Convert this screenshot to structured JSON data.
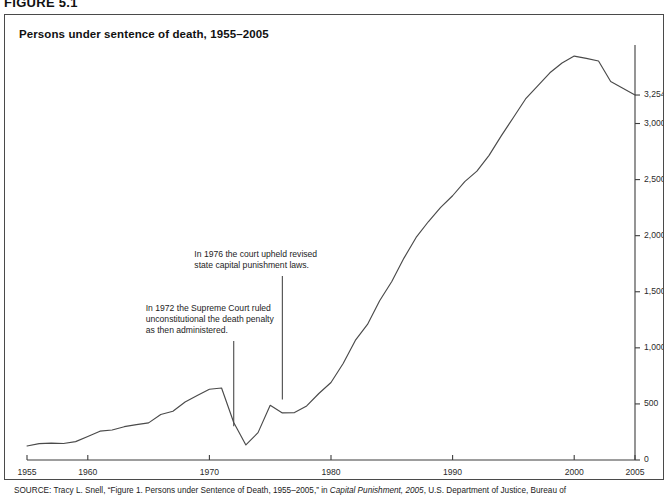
{
  "figure": {
    "number_label": "FIGURE 5.1",
    "title": "Persons under sentence of death, 1955–2005",
    "source_prefix": "SOURCE:",
    "source_text_1": " Tracy L. Snell, “Figure 1. Persons under Sentence of Death, 1955–2005,” in ",
    "source_italic": "Capital Punishment, 2005",
    "source_text_2": ", U.S. Department of Justice, Bureau of"
  },
  "chart_data": {
    "type": "line",
    "title": "Persons under sentence of death, 1955–2005",
    "xlabel": "",
    "ylabel": "",
    "grid": false,
    "legend": "none",
    "xlim": [
      1955,
      2005
    ],
    "ylim": [
      0,
      3700
    ],
    "xticks": [
      1955,
      1960,
      1970,
      1980,
      1990,
      2000,
      2005
    ],
    "xticklabels": [
      "1955",
      "1960",
      "1970",
      "1980",
      "1990",
      "2000",
      "2005"
    ],
    "yticks": [
      0,
      500,
      1000,
      1500,
      2000,
      2500,
      3000,
      3254
    ],
    "yticklabels": [
      "0",
      "500",
      "1,000",
      "1,500",
      "2,000",
      "2,500",
      "3,000",
      "3,254"
    ],
    "x": [
      1955,
      1956,
      1957,
      1958,
      1959,
      1960,
      1961,
      1962,
      1963,
      1964,
      1965,
      1966,
      1967,
      1968,
      1969,
      1970,
      1971,
      1972,
      1973,
      1974,
      1975,
      1976,
      1977,
      1978,
      1979,
      1980,
      1981,
      1982,
      1983,
      1984,
      1985,
      1986,
      1987,
      1988,
      1989,
      1990,
      1991,
      1992,
      1993,
      1994,
      1995,
      1996,
      1997,
      1998,
      1999,
      2000,
      2001,
      2002,
      2003,
      2004,
      2005
    ],
    "values": [
      125,
      146,
      151,
      147,
      164,
      210,
      257,
      267,
      297,
      315,
      331,
      406,
      435,
      517,
      575,
      631,
      642,
      334,
      134,
      244,
      488,
      420,
      423,
      482,
      593,
      691,
      860,
      1066,
      1209,
      1420,
      1591,
      1800,
      1984,
      2124,
      2250,
      2356,
      2482,
      2575,
      2716,
      2890,
      3054,
      3219,
      3335,
      3452,
      3540,
      3601,
      3581,
      3557,
      3374,
      3315,
      3254
    ],
    "annotations": [
      {
        "id": "annotation-1972",
        "lines": [
          "In 1972 the Supreme Court ruled",
          "unconstitutional the death penalty",
          "as then administered."
        ],
        "target_year": 1972,
        "leader_from_y": 1060,
        "leader_to_y": 300
      },
      {
        "id": "annotation-1976",
        "lines": [
          "In 1976 the court upheld revised",
          "state capital punishment laws."
        ],
        "target_year": 1976,
        "leader_from_y": 1640,
        "leader_to_y": 540
      }
    ]
  }
}
